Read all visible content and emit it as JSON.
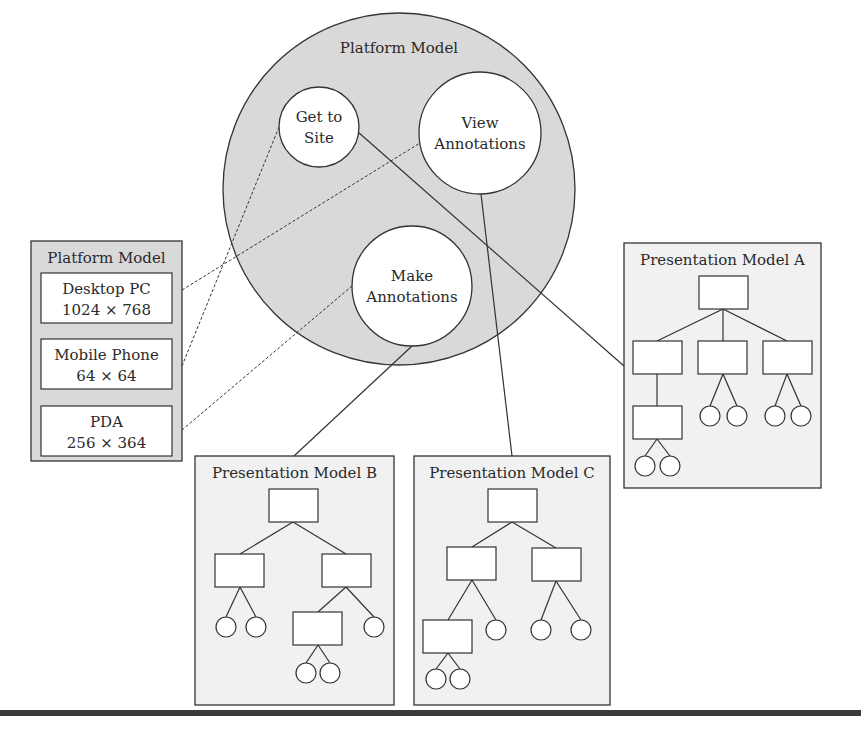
{
  "colors": {
    "panel_fill": "#d9d9d9",
    "box_fill": "#ffffff",
    "pres_fill": "#f1f1f1",
    "stroke": "#333333"
  },
  "platform_circle": {
    "title": "Platform Model",
    "cx": 399,
    "cy": 189,
    "r": 176,
    "tasks": [
      {
        "id": "get-to-site",
        "lines": [
          "Get to",
          "Site"
        ],
        "cx": 319,
        "cy": 127,
        "r": 40
      },
      {
        "id": "view-annotations",
        "lines": [
          "View",
          "Annotations"
        ],
        "cx": 480,
        "cy": 133,
        "r": 61
      },
      {
        "id": "make-annotations",
        "lines": [
          "Make",
          "Annotations"
        ],
        "cx": 412,
        "cy": 286,
        "r": 60
      }
    ]
  },
  "platform_box": {
    "title": "Platform Model",
    "x": 31,
    "y": 241,
    "w": 151,
    "h": 220,
    "devices": [
      {
        "name": "Desktop PC",
        "resolution": "1024 × 768",
        "x": 41,
        "y": 273,
        "w": 131,
        "h": 50
      },
      {
        "name": "Mobile Phone",
        "resolution": "64 × 64",
        "x": 41,
        "y": 339,
        "w": 131,
        "h": 50
      },
      {
        "name": "PDA",
        "resolution": "256 × 364",
        "x": 41,
        "y": 406,
        "w": 131,
        "h": 50
      }
    ]
  },
  "presentation_models": [
    {
      "id": "A",
      "title": "Presentation Model A",
      "x": 624,
      "y": 243,
      "w": 197,
      "h": 245,
      "rects": [
        [
          699,
          276,
          49,
          33
        ],
        [
          633,
          341,
          49,
          33
        ],
        [
          698,
          341,
          49,
          33
        ],
        [
          763,
          341,
          49,
          33
        ],
        [
          633,
          406,
          49,
          33
        ]
      ],
      "edges": [
        [
          723,
          309,
          657,
          341
        ],
        [
          723,
          309,
          723,
          341
        ],
        [
          723,
          309,
          787,
          341
        ],
        [
          657,
          374,
          657,
          406
        ],
        [
          723,
          374,
          710,
          406
        ],
        [
          723,
          374,
          737,
          406
        ],
        [
          787,
          374,
          775,
          406
        ],
        [
          787,
          374,
          801,
          406
        ],
        [
          657,
          439,
          645,
          456
        ],
        [
          657,
          439,
          670,
          456
        ]
      ],
      "circles": [
        [
          710,
          416,
          10
        ],
        [
          737,
          416,
          10
        ],
        [
          775,
          416,
          10
        ],
        [
          801,
          416,
          10
        ],
        [
          645,
          466,
          10
        ],
        [
          670,
          466,
          10
        ]
      ]
    },
    {
      "id": "B",
      "title": "Presentation Model B",
      "x": 195,
      "y": 456,
      "w": 199,
      "h": 249,
      "rects": [
        [
          269,
          489,
          49,
          33
        ],
        [
          215,
          554,
          49,
          33
        ],
        [
          322,
          554,
          49,
          33
        ],
        [
          293,
          612,
          49,
          33
        ]
      ],
      "edges": [
        [
          293,
          522,
          240,
          554
        ],
        [
          293,
          522,
          346,
          554
        ],
        [
          240,
          587,
          226,
          617
        ],
        [
          240,
          587,
          256,
          617
        ],
        [
          346,
          587,
          318,
          612
        ],
        [
          346,
          587,
          374,
          617
        ],
        [
          318,
          645,
          306,
          663
        ],
        [
          318,
          645,
          330,
          663
        ]
      ],
      "circles": [
        [
          226,
          627,
          10
        ],
        [
          256,
          627,
          10
        ],
        [
          374,
          627,
          10
        ],
        [
          306,
          673,
          10
        ],
        [
          330,
          673,
          10
        ]
      ]
    },
    {
      "id": "C",
      "title": "Presentation Model C",
      "x": 414,
      "y": 456,
      "w": 196,
      "h": 249,
      "rects": [
        [
          488,
          489,
          49,
          33
        ],
        [
          447,
          547,
          49,
          33
        ],
        [
          532,
          548,
          49,
          33
        ],
        [
          423,
          620,
          49,
          33
        ]
      ],
      "edges": [
        [
          512,
          522,
          472,
          547
        ],
        [
          512,
          522,
          556,
          548
        ],
        [
          472,
          580,
          448,
          620
        ],
        [
          472,
          580,
          496,
          620
        ],
        [
          556,
          581,
          541,
          620
        ],
        [
          556,
          581,
          581,
          620
        ],
        [
          448,
          653,
          436,
          669
        ],
        [
          448,
          653,
          460,
          669
        ]
      ],
      "circles": [
        [
          496,
          630,
          10
        ],
        [
          541,
          630,
          10
        ],
        [
          581,
          630,
          10
        ],
        [
          436,
          679,
          10
        ],
        [
          460,
          679,
          10
        ]
      ]
    }
  ],
  "connectors": {
    "dashed": [
      {
        "from": "Desktop PC",
        "to": "View Annotations",
        "x1": 182,
        "y1": 290,
        "x2": 420,
        "y2": 143
      },
      {
        "from": "Mobile Phone",
        "to": "Get to Site",
        "x1": 182,
        "y1": 366,
        "x2": 279,
        "y2": 127
      },
      {
        "from": "PDA",
        "to": "Make Annotations",
        "x1": 182,
        "y1": 430,
        "x2": 352,
        "y2": 286
      }
    ],
    "solid": [
      {
        "from": "Get to Site",
        "to": "Presentation Model A",
        "x1": 358,
        "y1": 132,
        "x2": 624,
        "y2": 366
      },
      {
        "from": "View Annotations",
        "to": "Presentation Model C",
        "x1": 481,
        "y1": 194,
        "x2": 512,
        "y2": 456
      },
      {
        "from": "Make Annotations",
        "to": "Presentation Model B",
        "x1": 412,
        "y1": 346,
        "x2": 294,
        "y2": 456
      }
    ]
  }
}
